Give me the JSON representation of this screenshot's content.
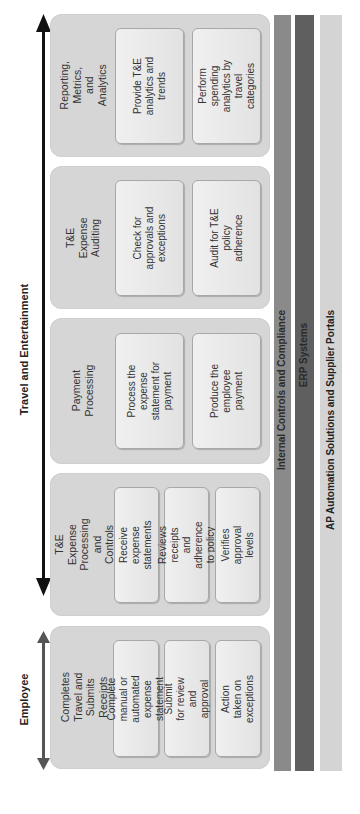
{
  "axes": {
    "top_label": "Travel and Entertainment",
    "employee_label": "Employee"
  },
  "colors": {
    "panel": "#d6d6d6",
    "bar_internal_controls": "#8a8a8a",
    "bar_erp": "#5f5f5f",
    "bar_ap": "#d4d4d4",
    "arrow_main": "#111111",
    "arrow_employee": "#555555"
  },
  "panels": [
    {
      "title": "Reporting, Metrics, and Analytics",
      "items": [
        "Provide T&E analytics and trends",
        "Perform spending analytics by travel categories"
      ]
    },
    {
      "title": "T&E Expense Auditing",
      "items": [
        "Check for approvals and exceptions",
        "Audit for T&E policy adherence"
      ]
    },
    {
      "title": "Payment Processing",
      "items": [
        "Process the expense statement for payment",
        "Produce the employee payment"
      ]
    },
    {
      "title": "T&E Expense Processing and Controls",
      "items": [
        "Receive expense statements",
        "Reviews receipts and adherence to policy",
        "Verifies approval levels"
      ]
    },
    {
      "title": "Completes Travel and Submits Receipts",
      "items": [
        "Complete manual or automated expense statement",
        "Submit for review and approval",
        "Action taken on exceptions"
      ]
    }
  ],
  "bars": [
    {
      "label": "Internal Controls and Compliance"
    },
    {
      "label": "ERP Systems"
    },
    {
      "label": "AP Automation Solutions and Supplier Portals"
    }
  ]
}
